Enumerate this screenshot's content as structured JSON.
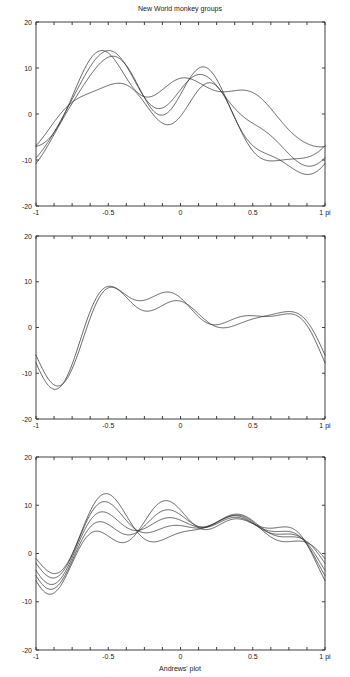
{
  "figure": {
    "title": "New World monkey groups",
    "xlabel": "Andrews' plot",
    "width": 350,
    "height": 677,
    "background": "#ffffff",
    "line_color": "#2f2f2f",
    "axis_color": "#2b2b2b"
  },
  "axes": {
    "ylim": [
      -20,
      20
    ],
    "xlim": [
      -1,
      1
    ],
    "y_ticks": [
      20,
      10,
      0,
      -10,
      -20
    ],
    "y_tick_labels": [
      "20",
      "10",
      "0",
      "-10",
      "-20"
    ],
    "x_ticks": [
      -1,
      -0.5,
      0,
      0.5,
      1
    ],
    "x_tick_labels": [
      "-1",
      "-0.5",
      "0",
      "0.5",
      "1 pi"
    ],
    "x_minor_tick_count": 16,
    "grid": false,
    "legend": "none"
  },
  "panels": [
    {
      "name": "panel-top",
      "title": "New World monkey groups",
      "curve_count": 4,
      "x_label_shown": true
    },
    {
      "name": "panel-middle",
      "title": "",
      "curve_count": 2,
      "x_label_shown": true
    },
    {
      "name": "panel-bottom",
      "title": "",
      "curve_count": 5,
      "x_label_shown": true
    }
  ],
  "chart_data": {
    "type": "line",
    "title": "New World monkey groups",
    "xlabel": "Andrews' plot",
    "ylabel": "",
    "xlim": [
      -1,
      1
    ],
    "ylim": [
      -20,
      20
    ],
    "x_tick_labels": [
      "-1",
      "-0.5",
      "0",
      "0.5",
      "1 pi"
    ],
    "y_tick_labels": [
      "20",
      "10",
      "0",
      "-10",
      "-20"
    ],
    "grid": false,
    "legend": "none",
    "panels": [
      {
        "name": "panel-top",
        "series": [
          {
            "name": "group-1",
            "coeffs": [
              4.9,
              -3.2,
              5.2,
              2.1,
              -4.3,
              1.1,
              2.2,
              -0.5,
              1.2
            ]
          },
          {
            "name": "group-2",
            "coeffs": [
              2.1,
              -5.6,
              6.4,
              3.6,
              -4.0,
              2.3,
              1.0,
              1.1,
              0.4
            ]
          },
          {
            "name": "group-3",
            "coeffs": [
              0.2,
              -6.5,
              7.3,
              4.4,
              -3.0,
              3.1,
              0.2,
              1.6,
              -0.4
            ]
          },
          {
            "name": "group-4",
            "coeffs": [
              -1.4,
              -5.1,
              4.4,
              4.0,
              -1.4,
              2.0,
              -1.2,
              0.9,
              -1.3
            ]
          }
        ]
      },
      {
        "name": "panel-middle",
        "series": [
          {
            "name": "group-5",
            "coeffs": [
              2.1,
              -0.6,
              5.6,
              -4.1,
              -3.2,
              2.6,
              1.5,
              -1.9,
              1.1
            ]
          },
          {
            "name": "group-6",
            "coeffs": [
              1.5,
              -0.1,
              4.6,
              -4.0,
              -2.7,
              3.3,
              1.3,
              -1.1,
              1.5
            ]
          }
        ]
      },
      {
        "name": "panel-bottom",
        "series": [
          {
            "name": "group-7",
            "coeffs": [
              6.2,
              0.1,
              3.3,
              -0.4,
              -3.4,
              2.0,
              0.6,
              -1.6,
              0.9
            ]
          },
          {
            "name": "group-8",
            "coeffs": [
              5.8,
              0.6,
              4.1,
              -0.9,
              -2.8,
              1.6,
              1.1,
              -1.9,
              0.4
            ]
          },
          {
            "name": "group-9",
            "coeffs": [
              5.4,
              1.2,
              4.7,
              -1.4,
              -2.2,
              1.1,
              1.6,
              -2.1,
              0.1
            ]
          },
          {
            "name": "group-10",
            "coeffs": [
              6.0,
              -0.4,
              2.6,
              0.2,
              -3.9,
              2.5,
              0.1,
              -1.2,
              1.3
            ]
          },
          {
            "name": "group-11",
            "coeffs": [
              5.1,
              1.8,
              5.2,
              -2.1,
              -1.6,
              0.5,
              2.1,
              -2.4,
              -0.3
            ]
          }
        ]
      }
    ]
  }
}
